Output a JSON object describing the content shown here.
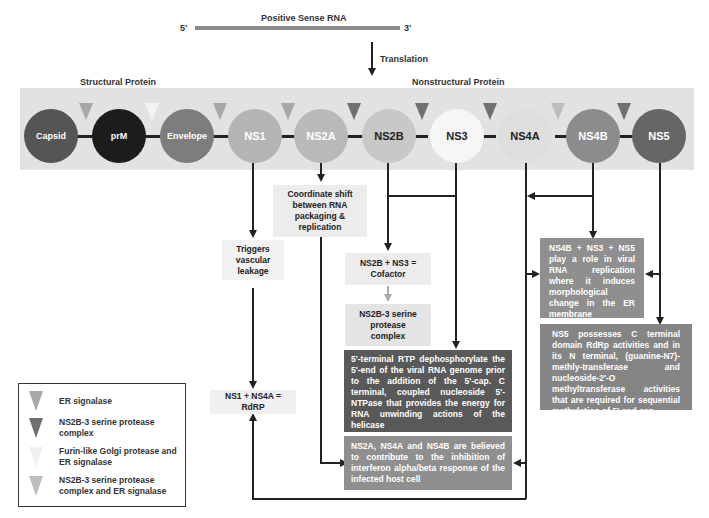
{
  "header": {
    "rna_label": "Positive Sense RNA",
    "five_prime": "5'",
    "three_prime": "3'",
    "translation_label": "Translation",
    "structural_label": "Structural Protein",
    "nonstructural_label": "Nonstructural Protein"
  },
  "colors": {
    "band": "#e2e2e2",
    "er_signalase": "#a8a8a8",
    "ns2b3_protease": "#707070",
    "furin_golgi": "#f4f4f4",
    "ns2b3_and_er": "#bdbdbd"
  },
  "proteins": [
    {
      "name": "Capsid",
      "color": "#555555",
      "text_color": "#ffffff"
    },
    {
      "name": "prM",
      "color": "#1c1c1c",
      "text_color": "#ffffff"
    },
    {
      "name": "Envelope",
      "color": "#7d7d7d",
      "text_color": "#ffffff"
    },
    {
      "name": "NS1",
      "color": "#b4b4b4",
      "text_color": "#ffffff"
    },
    {
      "name": "NS2A",
      "color": "#b9b9b9",
      "text_color": "#ffffff"
    },
    {
      "name": "NS2B",
      "color": "#c8c8c8",
      "text_color": "#222222"
    },
    {
      "name": "NS3",
      "color": "#f6f6f6",
      "text_color": "#222222"
    },
    {
      "name": "NS4A",
      "color": "#dedede",
      "text_color": "#222222"
    },
    {
      "name": "NS4B",
      "color": "#8c8c8c",
      "text_color": "#ffffff"
    },
    {
      "name": "NS5",
      "color": "#666666",
      "text_color": "#ffffff"
    }
  ],
  "cleavage_sites": [
    {
      "between": "Capsid-prM",
      "type": "ER signalase"
    },
    {
      "between": "prM-Envelope",
      "type": "Furin-like Golgi protease and ER signalase"
    },
    {
      "between": "Envelope-NS1",
      "type": "ER signalase"
    },
    {
      "between": "NS1-NS2A",
      "type": "ER signalase"
    },
    {
      "between": "NS2A-NS2B",
      "type": "NS2B-3 serine protease complex"
    },
    {
      "between": "NS2B-NS3",
      "type": "NS2B-3 serine protease complex"
    },
    {
      "between": "NS3-NS4A",
      "type": "NS2B-3 serine protease complex"
    },
    {
      "between": "NS4A-NS4B",
      "type": "NS2B-3 serine protease complex and ER signalase"
    },
    {
      "between": "NS4B-NS5",
      "type": "NS2B-3 serine protease complex"
    }
  ],
  "boxes": {
    "ns2a_function": "Coordinate shift between RNA packaging & replication",
    "ns1_function": "Triggers vascular leakage",
    "cofactor": "NS2B + NS3 = Cofactor",
    "protease_complex": "NS2B-3 serine protease complex",
    "ns3_function": "5'-terminal RTP dephosphorylate the 5'-end of the viral RNA genome prior to the addition of the 5'-cap. C terminal, coupled nucleoside 5'-NTPase that provides the energy for RNA unwinding actions of the helicase",
    "rdrp": "NS1 + NS4A = RdRP",
    "interferon": "NS2A, NS4A and NS4B are believed to contribute to the inhibition of interferon alpha/beta response of the infected host cell",
    "replication": "NS4B + NS3 + NS5 play a role in viral RNA replication where it induces morphological change in the ER membrane",
    "ns5_function": "NS5 possesses C terminal domain RdRp activities and in its N terminal, (guanine-N7)-methly-transferase and nucleoside-2'-O methyltransferase activities that are required for sequential methylation of 5' end cap"
  },
  "legend": {
    "items": [
      {
        "label": "ER signalase"
      },
      {
        "label": "NS2B-3 serine protease complex"
      },
      {
        "label": "Furin-like Golgi protease and ER signalase"
      },
      {
        "label": "NS2B-3 serine protease complex and ER signalase"
      }
    ]
  }
}
